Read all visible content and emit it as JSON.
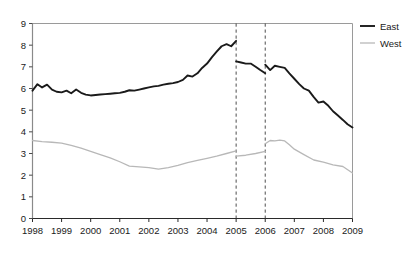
{
  "chart_data": {
    "type": "line",
    "title": "",
    "subtitle": "",
    "xlabel": "",
    "ylabel": "",
    "xlim": [
      1998,
      2009
    ],
    "ylim": [
      0,
      9
    ],
    "grid": false,
    "legend_position": "right",
    "x_tick_labels": [
      "1998",
      "1999",
      "2000",
      "2001",
      "2002",
      "2003",
      "2004",
      "2005",
      "2006",
      "2007",
      "2008",
      "2009"
    ],
    "y_tick_labels": [
      "0",
      "1",
      "2",
      "3",
      "4",
      "5",
      "6",
      "7",
      "8",
      "9"
    ],
    "y_ticks": [
      0,
      1,
      2,
      3,
      4,
      5,
      6,
      7,
      8,
      9
    ],
    "x_ticks": [
      1998,
      1999,
      2000,
      2001,
      2002,
      2003,
      2004,
      2005,
      2006,
      2007,
      2008,
      2009
    ],
    "annotations": [
      {
        "type": "vertical-dashed-line",
        "x": 2005,
        "label": "2005"
      },
      {
        "type": "vertical-dashed-line",
        "x": 2006,
        "label": "2006"
      }
    ],
    "series": [
      {
        "name": "East",
        "color": "#1a1a1a",
        "segments": [
          {
            "x": [
              1998.0,
              1998.17,
              1998.33,
              1998.5,
              1998.67,
              1998.83,
              1999.0,
              1999.17,
              1999.33,
              1999.5,
              1999.67,
              1999.83,
              2000.0,
              2000.17,
              2000.33,
              2000.5,
              2000.67,
              2000.83,
              2001.0,
              2001.17,
              2001.33,
              2001.5,
              2001.67,
              2001.83,
              2002.0,
              2002.17,
              2002.33,
              2002.5,
              2002.67,
              2002.83,
              2003.0,
              2003.17,
              2003.33,
              2003.5,
              2003.67,
              2003.83,
              2004.0,
              2004.17,
              2004.33,
              2004.5,
              2004.67,
              2004.83,
              2005.0
            ],
            "y": [
              5.9,
              6.2,
              6.05,
              6.18,
              5.95,
              5.85,
              5.82,
              5.9,
              5.78,
              5.95,
              5.8,
              5.72,
              5.68,
              5.7,
              5.72,
              5.74,
              5.76,
              5.78,
              5.8,
              5.85,
              5.92,
              5.9,
              5.95,
              6.0,
              6.05,
              6.1,
              6.12,
              6.18,
              6.22,
              6.25,
              6.3,
              6.4,
              6.6,
              6.55,
              6.7,
              6.95,
              7.15,
              7.45,
              7.7,
              7.95,
              8.05,
              7.95,
              8.2
            ]
          },
          {
            "x": [
              2005.0,
              2005.17,
              2005.33,
              2005.5,
              2005.67,
              2005.83,
              2006.0
            ],
            "y": [
              7.25,
              7.2,
              7.15,
              7.15,
              7.0,
              6.85,
              6.7
            ]
          },
          {
            "x": [
              2006.0,
              2006.17,
              2006.33,
              2006.5,
              2006.67,
              2006.83,
              2007.0,
              2007.17,
              2007.33,
              2007.5,
              2007.67,
              2007.83,
              2008.0,
              2008.17,
              2008.33,
              2008.5,
              2008.67,
              2008.83,
              2009.0
            ],
            "y": [
              7.1,
              6.85,
              7.05,
              7.0,
              6.95,
              6.7,
              6.45,
              6.2,
              6.0,
              5.9,
              5.6,
              5.35,
              5.4,
              5.2,
              4.95,
              4.75,
              4.55,
              4.35,
              4.2
            ]
          }
        ]
      },
      {
        "name": "West",
        "color": "#b8b8b8",
        "segments": [
          {
            "x": [
              1998.0,
              1998.33,
              1998.67,
              1999.0,
              1999.33,
              1999.67,
              2000.0,
              2000.33,
              2000.67,
              2001.0,
              2001.33,
              2001.67,
              2002.0,
              2002.33,
              2002.67,
              2003.0,
              2003.33,
              2003.67,
              2004.0,
              2004.33,
              2004.67,
              2005.0
            ],
            "y": [
              3.6,
              3.55,
              3.52,
              3.48,
              3.38,
              3.25,
              3.1,
              2.95,
              2.8,
              2.62,
              2.42,
              2.38,
              2.35,
              2.28,
              2.35,
              2.45,
              2.58,
              2.68,
              2.78,
              2.88,
              3.0,
              3.12
            ]
          },
          {
            "x": [
              2005.0,
              2005.33,
              2005.67,
              2006.0
            ],
            "y": [
              2.88,
              2.92,
              3.0,
              3.1
            ]
          },
          {
            "x": [
              2006.0,
              2006.17,
              2006.33,
              2006.5,
              2006.67,
              2006.83,
              2007.0,
              2007.33,
              2007.67,
              2008.0,
              2008.33,
              2008.67,
              2009.0
            ],
            "y": [
              3.45,
              3.6,
              3.58,
              3.62,
              3.58,
              3.4,
              3.2,
              2.95,
              2.7,
              2.6,
              2.48,
              2.4,
              2.1
            ]
          }
        ]
      }
    ],
    "legend": [
      {
        "label": "East",
        "color": "#1a1a1a",
        "width": 1.9
      },
      {
        "label": "West",
        "color": "#b8b8b8",
        "width": 1.3
      }
    ]
  }
}
